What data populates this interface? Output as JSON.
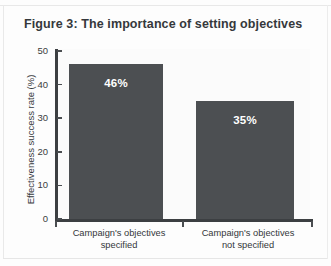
{
  "figure": {
    "title": "Figure 3: The importance of setting objectives"
  },
  "chart_data": {
    "type": "bar",
    "title": "Figure 3: The importance of setting objectives",
    "categories": [
      "Campaign's objectives specified",
      "Campaign's objectives not specified"
    ],
    "category_lines": [
      [
        "Campaign's objectives",
        "specified"
      ],
      [
        "Campaign's objectives",
        "not specified"
      ]
    ],
    "values": [
      46,
      35
    ],
    "value_labels": [
      "46%",
      "35%"
    ],
    "xlabel": "",
    "ylabel": "Effectiveness success rate (%)",
    "ylim": [
      0,
      50
    ],
    "yticks": [
      0,
      10,
      20,
      30,
      40,
      50
    ],
    "ytick_labels": [
      "0",
      "10",
      "20",
      "30",
      "40",
      "50"
    ],
    "grid": false,
    "legend": false,
    "bar_color": "#4c4f52",
    "value_label_color": "#ffffff",
    "axis_color": "#3c3f42",
    "plot_background": "#fbfbfb"
  }
}
